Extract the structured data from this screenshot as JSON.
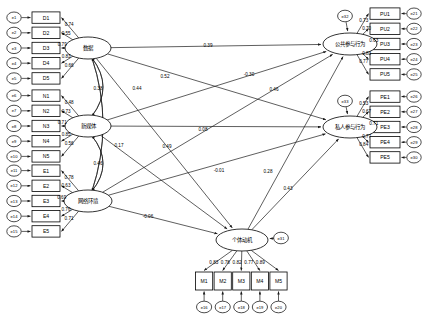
{
  "diagram": {
    "type": "structural-equation-model-path-diagram",
    "colors": {
      "stroke": "#1a1a1a",
      "node_fill": "#ffffff",
      "background": "#ffffff"
    },
    "latents": [
      {
        "id": "D",
        "label": "数据",
        "cx": 88,
        "cy": 48,
        "rx": 23,
        "ry": 11
      },
      {
        "id": "N",
        "label": "新媒体",
        "cx": 88,
        "cy": 126,
        "rx": 23,
        "ry": 11
      },
      {
        "id": "E",
        "label": "网络环境",
        "cx": 88,
        "cy": 201,
        "rx": 24,
        "ry": 11
      },
      {
        "id": "M",
        "label": "个体动机",
        "cx": 242,
        "cy": 240,
        "rx": 26,
        "ry": 11
      },
      {
        "id": "PU",
        "label": "公共参与行为",
        "cx": 350,
        "cy": 44,
        "rx": 27,
        "ry": 11
      },
      {
        "id": "PE",
        "label": "私人参与行为",
        "cx": 350,
        "cy": 127,
        "rx": 27,
        "ry": 11
      }
    ],
    "indicator_groups": [
      {
        "latent": "D",
        "side": "left",
        "items": [
          {
            "name": "D1",
            "error": "e1",
            "loading": "0.74"
          },
          {
            "name": "D2",
            "error": "e2",
            "loading": "0.55"
          },
          {
            "name": "D3",
            "error": "e3",
            "loading": "0.79"
          },
          {
            "name": "D4",
            "error": "e4",
            "loading": "0.83"
          },
          {
            "name": "D5",
            "error": "e5",
            "loading": "0.66"
          }
        ]
      },
      {
        "latent": "N",
        "side": "left",
        "items": [
          {
            "name": "N1",
            "error": "e6",
            "loading": "0.48"
          },
          {
            "name": "N2",
            "error": "e7",
            "loading": "0.73"
          },
          {
            "name": "N3",
            "error": "e8",
            "loading": "0.71"
          },
          {
            "name": "N4",
            "error": "e9",
            "loading": "0.85"
          },
          {
            "name": "N5",
            "error": "e10",
            "loading": "0.56"
          }
        ]
      },
      {
        "latent": "E",
        "side": "left",
        "items": [
          {
            "name": "E1",
            "error": "e11",
            "loading": "0.78"
          },
          {
            "name": "E2",
            "error": "e12",
            "loading": "0.63"
          },
          {
            "name": "E3",
            "error": "e13",
            "loading": "0.69"
          },
          {
            "name": "E4",
            "error": "e14",
            "loading": "0.76"
          },
          {
            "name": "E5",
            "error": "e15",
            "loading": "0.71"
          }
        ]
      },
      {
        "latent": "PU",
        "side": "right",
        "items": [
          {
            "name": "PU1",
            "error": "e21",
            "loading": "0.73"
          },
          {
            "name": "PU2",
            "error": "e22",
            "loading": "0.70"
          },
          {
            "name": "PU3",
            "error": "e23",
            "loading": "0.63"
          },
          {
            "name": "PU4",
            "error": "e24",
            "loading": "0.83"
          },
          {
            "name": "PU5",
            "error": "e25",
            "loading": "0.77"
          }
        ]
      },
      {
        "latent": "PE",
        "side": "right",
        "items": [
          {
            "name": "PE1",
            "error": "e26",
            "loading": "0.53"
          },
          {
            "name": "PE2",
            "error": "e27",
            "loading": "0.67"
          },
          {
            "name": "PE3",
            "error": "e28",
            "loading": "0.71"
          },
          {
            "name": "PE4",
            "error": "e29",
            "loading": "0.77"
          },
          {
            "name": "PE5",
            "error": "e30",
            "loading": "0.84"
          }
        ]
      },
      {
        "latent": "M",
        "side": "bottom",
        "items": [
          {
            "name": "M1",
            "error": "e16",
            "loading": "0.83"
          },
          {
            "name": "M2",
            "error": "e17",
            "loading": "0.78"
          },
          {
            "name": "M3",
            "error": "e18",
            "loading": "0.82"
          },
          {
            "name": "M4",
            "error": "e19",
            "loading": "0.77"
          },
          {
            "name": "M5",
            "error": "e20",
            "loading": "0.89"
          }
        ]
      }
    ],
    "disturbances": [
      {
        "id": "e31",
        "for": "M",
        "cx": 281,
        "cy": 238
      },
      {
        "id": "e32",
        "for": "PU",
        "cx": 345,
        "cy": 16
      },
      {
        "id": "e33",
        "for": "PE",
        "cx": 345,
        "cy": 101
      }
    ],
    "structural_paths": [
      {
        "from": "D",
        "to": "PU",
        "coef": "0.39",
        "lx": 208,
        "ly": 45
      },
      {
        "from": "D",
        "to": "PE",
        "coef": "0.52",
        "lx": 165,
        "ly": 76
      },
      {
        "from": "N",
        "to": "PU",
        "coef": "-0.30",
        "lx": 249,
        "ly": 74
      },
      {
        "from": "N",
        "to": "PE",
        "coef": "0.08",
        "lx": 203,
        "ly": 129
      },
      {
        "from": "E",
        "to": "PU",
        "coef": "0.46",
        "lx": 274,
        "ly": 89
      },
      {
        "from": "E",
        "to": "PE",
        "coef": "0.49",
        "lx": 167,
        "ly": 146
      },
      {
        "from": "D",
        "to": "M",
        "coef": "-0.01",
        "lx": 219,
        "ly": 170
      },
      {
        "from": "N",
        "to": "M",
        "coef": "0.17",
        "lx": 119,
        "ly": 145
      },
      {
        "from": "E",
        "to": "M",
        "coef": "-0.06",
        "lx": 148,
        "ly": 216
      },
      {
        "from": "M",
        "to": "PU",
        "coef": "0.28",
        "lx": 268,
        "ly": 171
      },
      {
        "from": "M",
        "to": "PE",
        "coef": "0.43",
        "lx": 288,
        "ly": 188
      }
    ],
    "covariances": [
      {
        "between": [
          "D",
          "N"
        ],
        "coef": "0.38",
        "lx": 98,
        "ly": 88
      },
      {
        "between": [
          "D",
          "E"
        ],
        "coef": "0.44",
        "lx": 137,
        "ly": 88
      },
      {
        "between": [
          "N",
          "E"
        ],
        "coef": "0.46",
        "lx": 98,
        "ly": 163
      }
    ]
  }
}
